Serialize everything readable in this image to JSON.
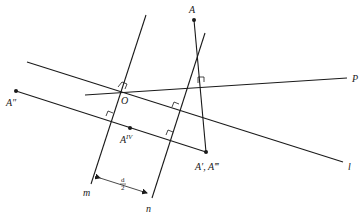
{
  "diagram": {
    "labels": {
      "A": "A",
      "A_double_prime": "A″",
      "A_iv_base": "A",
      "A_iv_sup": "IV",
      "A_prime_triple": "A′, A‴",
      "O": "O",
      "P": "P",
      "l": "l",
      "m": "m",
      "n": "n",
      "dist_num": "d",
      "dist_den": "2"
    },
    "lines": [
      {
        "name": "m",
        "from": [
          146,
          15
        ],
        "to": [
          91,
          184
        ]
      },
      {
        "name": "n",
        "from": [
          205,
          33
        ],
        "to": [
          152,
          198
        ]
      },
      {
        "name": "l",
        "from": [
          27,
          62
        ],
        "to": [
          343,
          162
        ]
      },
      {
        "name": "P",
        "from": [
          85,
          95
        ],
        "to": [
          347,
          78
        ]
      },
      {
        "name": "A''-A'",
        "from": [
          16,
          91
        ],
        "to": [
          206,
          152
        ]
      },
      {
        "name": "A-A'",
        "from": [
          194,
          20
        ],
        "to": [
          206,
          152
        ]
      }
    ],
    "points": [
      {
        "name": "A",
        "at": [
          194,
          20
        ]
      },
      {
        "name": "A''",
        "at": [
          16,
          91
        ]
      },
      {
        "name": "A_IV",
        "at": [
          130,
          128
        ]
      },
      {
        "name": "A', A'''",
        "at": [
          206,
          152
        ]
      },
      {
        "name": "O",
        "at": [
          122,
          90
        ]
      }
    ],
    "colors": {
      "ink": "#1a1a1a",
      "background": "#ffffff"
    }
  }
}
